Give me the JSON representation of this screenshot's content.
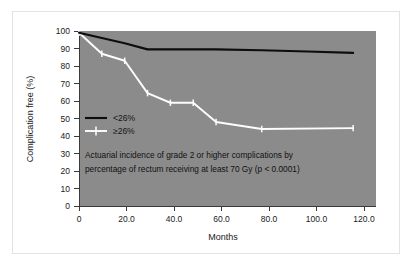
{
  "figure": {
    "background_color": "#ffffff",
    "frame_border_color": "#e3e3e3",
    "plot_area_color": "#8b8b8b"
  },
  "chart_data": {
    "type": "line",
    "title": "",
    "subtitle": "",
    "xlabel": "Months",
    "ylabel": "Complication free (%)",
    "xlim": [
      0,
      130
    ],
    "ylim": [
      0,
      100
    ],
    "grid": false,
    "legend_position": "inside-left-middle",
    "x_tick_labels": [
      "0",
      "20.0",
      "40.0",
      "60.0",
      "80.0",
      "100.0",
      "120.0"
    ],
    "x_tick_values": [
      0,
      20,
      40,
      60,
      80,
      100,
      120
    ],
    "y_tick_labels": [
      "0",
      "10",
      "20",
      "30",
      "40",
      "50",
      "60",
      "70",
      "80",
      "90",
      "100"
    ],
    "y_tick_values": [
      0,
      10,
      20,
      30,
      40,
      50,
      60,
      70,
      80,
      90,
      100
    ],
    "annotations": [
      "Actuarial incidence of grade 2 or higher complications by",
      "percentage of rectum receiving at least 70 Gy (p < 0.0001)"
    ],
    "series": [
      {
        "name": "<26%",
        "color": "#0d0d0d",
        "style": "solid-line",
        "marker": "none",
        "x": [
          0,
          10,
          20,
          30,
          40,
          50,
          60,
          80,
          100,
          120
        ],
        "values": [
          99,
          96,
          93,
          89.5,
          89.5,
          89.5,
          89.5,
          89,
          88.3,
          87.5
        ]
      },
      {
        "name": "≥26%",
        "color": "#fdfdfd",
        "style": "solid-line-with-plus-markers",
        "marker": "plus",
        "x": [
          0,
          10,
          20,
          30,
          40,
          50,
          60,
          80,
          120
        ],
        "values": [
          99,
          87,
          83,
          64.5,
          59,
          59,
          48,
          44,
          44.5
        ]
      }
    ]
  },
  "legend": {
    "items": [
      {
        "label": "<26%",
        "color": "#0d0d0d",
        "marker": "none"
      },
      {
        "label": "≥26%",
        "color": "#fdfdfd",
        "marker": "plus"
      }
    ]
  }
}
